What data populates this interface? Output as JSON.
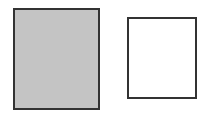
{
  "shapes": [
    {
      "name": "filled-rectangle",
      "fill": "#c4c4c4",
      "stroke": "#333333"
    },
    {
      "name": "empty-rectangle",
      "fill": "#ffffff",
      "stroke": "#333333"
    }
  ]
}
